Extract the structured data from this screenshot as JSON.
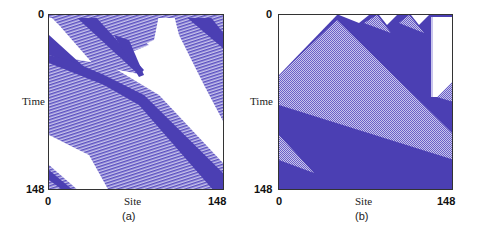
{
  "figure": {
    "colors": {
      "solid": "#4b3fb3",
      "hatch_fg": "#5a4fc0",
      "hatch_bg": "#c9c5ec",
      "background": "#ffffff"
    },
    "panels": [
      {
        "id": "a",
        "caption": "(a)",
        "xlabel": "Site",
        "ylabel": "Time",
        "x_ticks": [
          "0",
          "148"
        ],
        "y_ticks": [
          "0",
          "148"
        ]
      },
      {
        "id": "b",
        "caption": "(b)",
        "xlabel": "Site",
        "ylabel": "Time",
        "x_ticks": [
          "0",
          "148"
        ],
        "y_ticks": [
          "0",
          "148"
        ]
      }
    ]
  }
}
